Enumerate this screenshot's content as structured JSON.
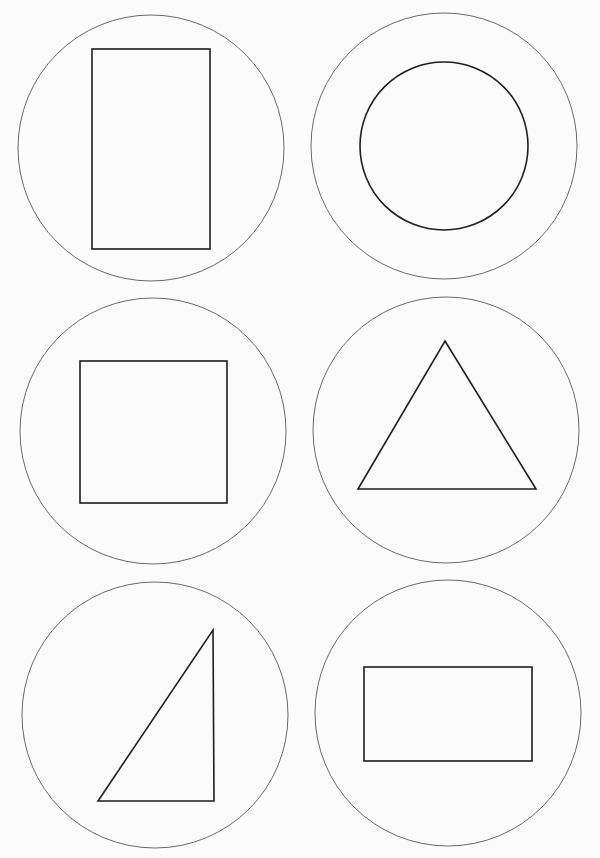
{
  "canvas": {
    "width": 600,
    "height": 858,
    "background": "#fbfbfb"
  },
  "colors": {
    "outer_stroke": "#6a6a6a",
    "shape_stroke": "#1f1f1f"
  },
  "panels": [
    {
      "name": "tall-rectangle",
      "outer_circle": {
        "cx": 151,
        "cy": 148,
        "r": 133
      },
      "shape": {
        "type": "rect",
        "x": 92,
        "y": 49,
        "width": 118,
        "height": 200
      }
    },
    {
      "name": "circle",
      "outer_circle": {
        "cx": 444,
        "cy": 146,
        "r": 133
      },
      "shape": {
        "type": "circle",
        "cx": 444,
        "cy": 146,
        "r": 84
      }
    },
    {
      "name": "square",
      "outer_circle": {
        "cx": 153,
        "cy": 431,
        "r": 133
      },
      "shape": {
        "type": "rect",
        "x": 80,
        "y": 361,
        "width": 147,
        "height": 142
      }
    },
    {
      "name": "equilateral-triangle",
      "outer_circle": {
        "cx": 446,
        "cy": 430,
        "r": 133
      },
      "shape": {
        "type": "polygon",
        "points": "445,341 536,489 358,489"
      }
    },
    {
      "name": "right-triangle",
      "outer_circle": {
        "cx": 155,
        "cy": 715,
        "r": 133
      },
      "shape": {
        "type": "polygon",
        "points": "213,630 214,801 98,801"
      }
    },
    {
      "name": "wide-rectangle",
      "outer_circle": {
        "cx": 448,
        "cy": 713,
        "r": 133
      },
      "shape": {
        "type": "rect",
        "x": 364,
        "y": 667,
        "width": 168,
        "height": 94
      }
    }
  ]
}
